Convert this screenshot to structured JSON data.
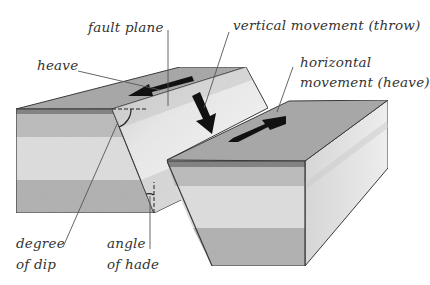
{
  "diagram": {
    "type": "normal-fault block diagram",
    "colors": {
      "top_face": "#a9a9a9",
      "dark_band": "#858585",
      "medium_band": "#bdbdbd",
      "light_band": "#dedede",
      "lower_band": "#b3b3b3",
      "fault_plane": "#e2e2e2",
      "side_face": "#e6e6e6",
      "outline": "#3a3a3a",
      "arrow": "#111111",
      "leader": "#555555"
    },
    "labels": {
      "fault_plane": "fault plane",
      "heave": "heave",
      "vertical_movement": "vertical movement (throw)",
      "horizontal_movement_line1": "horizontal",
      "horizontal_movement_line2": "movement (heave)",
      "degree_of_dip_line1": "degree",
      "degree_of_dip_line2": "of dip",
      "angle_of_hade_line1": "angle",
      "angle_of_hade_line2": "of hade"
    },
    "arrows": [
      {
        "name": "heave-arrow",
        "direction": "left",
        "from": [
          192,
          79
        ],
        "to": [
          128,
          95
        ]
      },
      {
        "name": "throw-arrow",
        "direction": "down",
        "from": [
          196,
          93
        ],
        "to": [
          212,
          134
        ]
      },
      {
        "name": "horizontal-movement-arrow",
        "direction": "up-right",
        "from": [
          228,
          142
        ],
        "to": [
          287,
          117
        ]
      }
    ]
  }
}
